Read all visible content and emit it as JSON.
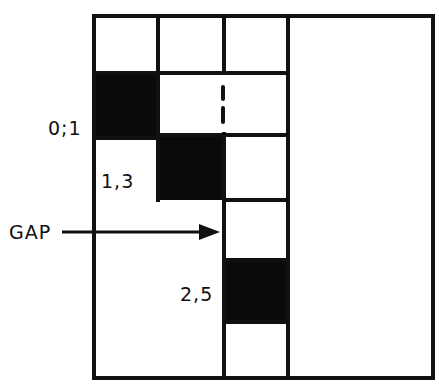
{
  "diagram": {
    "type": "block-allocation-grid",
    "colors": {
      "line": "#111111",
      "filled": "#0a0a0a",
      "background": "#ffffff"
    },
    "labels": {
      "block_0_1": "0;1",
      "block_1_3": "1,3",
      "gap": "GAP",
      "block_2_5": "2,5"
    },
    "columns": 4,
    "filled_blocks": [
      {
        "label": "0;1",
        "column": 1,
        "row_start": 2
      },
      {
        "label": "1,3",
        "column": 2,
        "row_start": 3
      },
      {
        "label": "2,5",
        "column": 3,
        "row_start": 5
      }
    ],
    "annotations": {
      "gap_arrow_target": "column 3, row 4",
      "dashed_marker": "between column 2 and 3, row 2"
    }
  }
}
